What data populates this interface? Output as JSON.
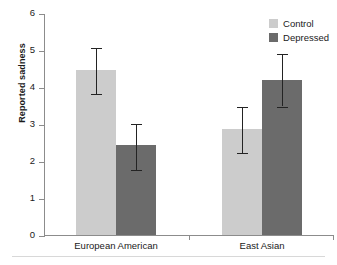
{
  "chart_data": {
    "type": "bar",
    "title": "",
    "xlabel": "",
    "ylabel": "Reported sadness",
    "ylim": [
      0,
      6
    ],
    "yticks": [
      "0",
      "1",
      "2",
      "3",
      "4",
      "5",
      "6"
    ],
    "grid": false,
    "legend_position": "top-right",
    "categories": [
      "European American",
      "East Asian"
    ],
    "series": [
      {
        "name": "Control",
        "color": "#cccccc",
        "values": [
          4.45,
          2.87
        ],
        "errors_low": [
          3.85,
          2.25
        ],
        "errors_high": [
          5.08,
          3.5
        ]
      },
      {
        "name": "Depressed",
        "color": "#6b6b6b",
        "values": [
          2.42,
          4.2
        ],
        "errors_low": [
          1.79,
          3.5
        ],
        "errors_high": [
          3.03,
          4.92
        ]
      }
    ]
  },
  "axis": {
    "ylabel": "Reported sadness",
    "tick_0": "0",
    "tick_1": "1",
    "tick_2": "2",
    "tick_3": "3",
    "tick_4": "4",
    "tick_5": "5",
    "tick_6": "6"
  },
  "categories": {
    "c0": "European American",
    "c1": "East Asian"
  },
  "legend": {
    "items": [
      {
        "label": "Control",
        "color": "#cccccc"
      },
      {
        "label": "Depressed",
        "color": "#6b6b6b"
      }
    ]
  }
}
